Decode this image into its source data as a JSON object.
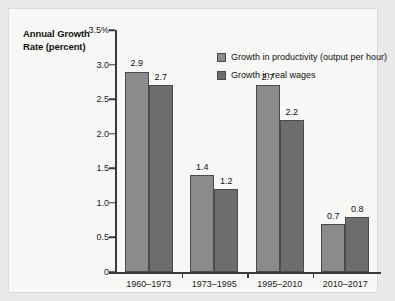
{
  "chart_data": {
    "type": "bar",
    "title": "",
    "ylabel": "Annual Growth Rate (percent)",
    "xlabel": "",
    "categories": [
      "1960–1973",
      "1973–1995",
      "1995–2010",
      "2010–2017"
    ],
    "series": [
      {
        "name": "Growth in productivity (output per hour)",
        "color": "#8b8b8b",
        "values": [
          2.9,
          1.4,
          2.7,
          0.7
        ],
        "labels": [
          "2.9",
          "1.4",
          "2.7",
          "0.7"
        ]
      },
      {
        "name": "Growth in real wages",
        "color": "#6d6d6d",
        "values": [
          2.7,
          1.2,
          2.2,
          0.8
        ],
        "labels": [
          "2.7",
          "1.2",
          "2.2",
          "0.8"
        ]
      }
    ],
    "ylim": [
      0,
      3.5
    ],
    "yticks": [
      0,
      0.5,
      1.0,
      1.5,
      2.0,
      2.5,
      3.0,
      3.5
    ],
    "ytick_labels": [
      "0",
      "0.5",
      "1.0",
      "1.5",
      "2.0",
      "2.5",
      "3.0",
      "3.5%"
    ],
    "grid": false,
    "legend_position": "top-right"
  },
  "axis_title": {
    "line1": "Annual Growth",
    "line2": "Rate (percent)"
  },
  "colors": {
    "series_productivity": "#8b8b8b",
    "series_wages": "#6d6d6d",
    "axis": "#3a3a3a",
    "panel_background": "#f7f7f5",
    "page_background": "#e9e9e9"
  }
}
